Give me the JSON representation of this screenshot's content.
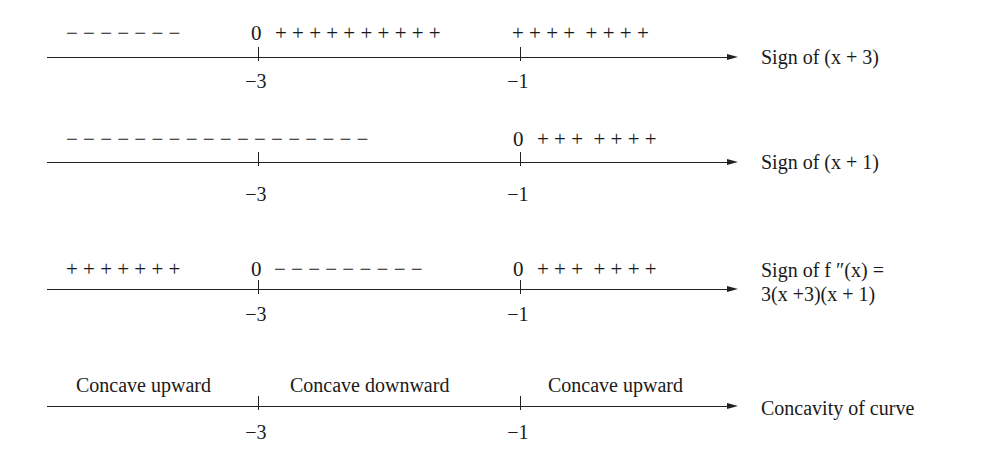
{
  "figure": {
    "ticks": [
      {
        "value": "−3",
        "x": 258
      },
      {
        "value": "−1",
        "x": 520
      }
    ],
    "rows": [
      {
        "id": "x-plus-3",
        "signs_left": "− − − − − − −",
        "zero_at_minus3": "0",
        "signs_mid": "+ + + + + + + + + +",
        "signs_right": "+ + + +  + + + +",
        "label": "Sign of (x + 3)"
      },
      {
        "id": "x-plus-1",
        "signs_left": "− − − − − − − − − − − − − − − − − −",
        "zero_at_minus1": "0",
        "signs_right": "+ + +  + + + +",
        "label": "Sign of (x + 1)"
      },
      {
        "id": "f-double-prime",
        "signs_left": "+ + + + + + +",
        "zero_at_minus3": "0",
        "signs_mid": "− − − − − − − − −",
        "zero_at_minus1": "0",
        "signs_right": "+ + +  + + + +",
        "label_line1": "Sign of f ″(x) =",
        "label_line2": "3(x +3)(x + 1)"
      },
      {
        "id": "concavity",
        "region_left": "Concave upward",
        "region_mid": "Concave downward",
        "region_right": "Concave upward",
        "label": "Concavity of curve"
      }
    ]
  }
}
